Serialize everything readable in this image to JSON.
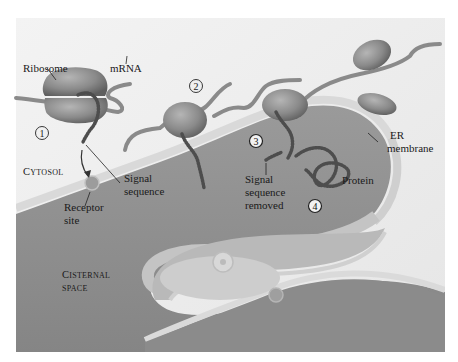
{
  "figure": {
    "type": "biology-diagram",
    "colors": {
      "background": "#ffffff",
      "cytosol": "#efefef",
      "lumen": "#8f8f8f",
      "membrane": "#d6d6d6",
      "ribosome": "#8c8c8c",
      "mrna": "#8a8a8a",
      "protein_beads": "#5a5a5a",
      "text": "#1a1a1a"
    }
  },
  "labels": {
    "ribosome": "Ribosome",
    "mrna": "mRNA",
    "cytosol_cap": "C",
    "cytosol_rest": "YTOSOL",
    "signal_sequence_line1": "Signal",
    "signal_sequence_line2": "sequence",
    "receptor_line1": "Receptor",
    "receptor_line2": "site",
    "signal_removed_line1": "Signal",
    "signal_removed_line2": "sequence",
    "signal_removed_line3": "removed",
    "protein": "Protein",
    "er_line1": "ER",
    "er_line2": "membrane",
    "cisternal_cap": "C",
    "cisternal_rest": "ISTERNAL",
    "space": "SPACE"
  },
  "steps": [
    {
      "number": "1",
      "style": "outline"
    },
    {
      "number": "2",
      "style": "outline"
    },
    {
      "number": "3",
      "style": "filled"
    },
    {
      "number": "4",
      "style": "filled"
    }
  ]
}
